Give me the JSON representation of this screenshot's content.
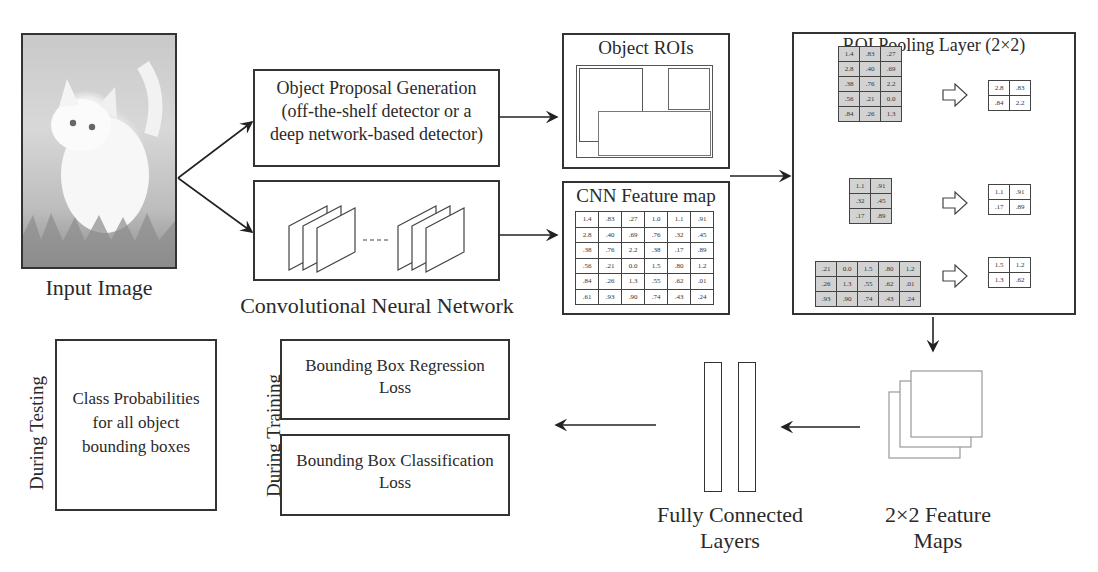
{
  "input_image": {
    "label": "Input Image",
    "subject": "white kitten photo"
  },
  "proposal_box": {
    "lines": [
      "Object Proposal Generation",
      "(off-the-shelf detector or a",
      "deep network-based detector)"
    ]
  },
  "cnn_box": {
    "label": "Convolutional Neural Network",
    "dashes": "----"
  },
  "object_rois": {
    "title": "Object ROIs"
  },
  "feature_map": {
    "title": "CNN Feature map",
    "rows": [
      [
        "1.4",
        ".83",
        ".27",
        "1.0",
        "1.1",
        ".91"
      ],
      [
        "2.8",
        ".40",
        ".69",
        ".76",
        ".32",
        ".45"
      ],
      [
        ".38",
        ".76",
        "2.2",
        ".38",
        ".17",
        ".89"
      ],
      [
        ".56",
        ".21",
        "0.0",
        "1.5",
        ".80",
        "1.2"
      ],
      [
        ".84",
        ".26",
        "1.3",
        ".55",
        ".62",
        ".01"
      ],
      [
        ".61",
        ".93",
        ".90",
        ".74",
        ".43",
        ".24"
      ]
    ]
  },
  "roi_pooling": {
    "title": "ROI Pooling Layer (2×2)",
    "examples": [
      {
        "input": [
          [
            "1.4",
            ".83",
            ".27"
          ],
          [
            "2.8",
            ".40",
            ".69"
          ],
          [
            ".38",
            ".76",
            "2.2"
          ],
          [
            ".56",
            ".21",
            "0.0"
          ],
          [
            ".84",
            ".26",
            "1.3"
          ]
        ],
        "output": [
          [
            "2.8",
            ".83"
          ],
          [
            ".84",
            "2.2"
          ]
        ]
      },
      {
        "input": [
          [
            "1.1",
            ".91"
          ],
          [
            ".32",
            ".45"
          ],
          [
            ".17",
            ".89"
          ]
        ],
        "output": [
          [
            "1.1",
            ".91"
          ],
          [
            ".17",
            ".89"
          ]
        ]
      },
      {
        "input": [
          [
            ".21",
            "0.0",
            "1.5",
            ".80",
            "1.2"
          ],
          [
            ".26",
            "1.3",
            ".55",
            ".62",
            ".01"
          ],
          [
            ".93",
            ".90",
            ".74",
            ".43",
            ".24"
          ]
        ],
        "output": [
          [
            "1.5",
            "1.2"
          ],
          [
            "1.3",
            ".62"
          ]
        ]
      }
    ]
  },
  "feature_maps_2x2": {
    "lines": [
      "2×2 Feature",
      "Maps"
    ]
  },
  "fc_layers": {
    "lines": [
      "Fully Connected",
      "Layers"
    ]
  },
  "training": {
    "side_label": "During Training",
    "regression": {
      "lines": [
        "Bounding Box Regression",
        "Loss"
      ]
    },
    "classification": {
      "lines": [
        "Bounding Box Classification",
        "Loss"
      ]
    }
  },
  "testing": {
    "side_label": "During Testing",
    "output": {
      "lines": [
        "Class Probabilities",
        "for all object",
        "bounding boxes"
      ]
    }
  }
}
